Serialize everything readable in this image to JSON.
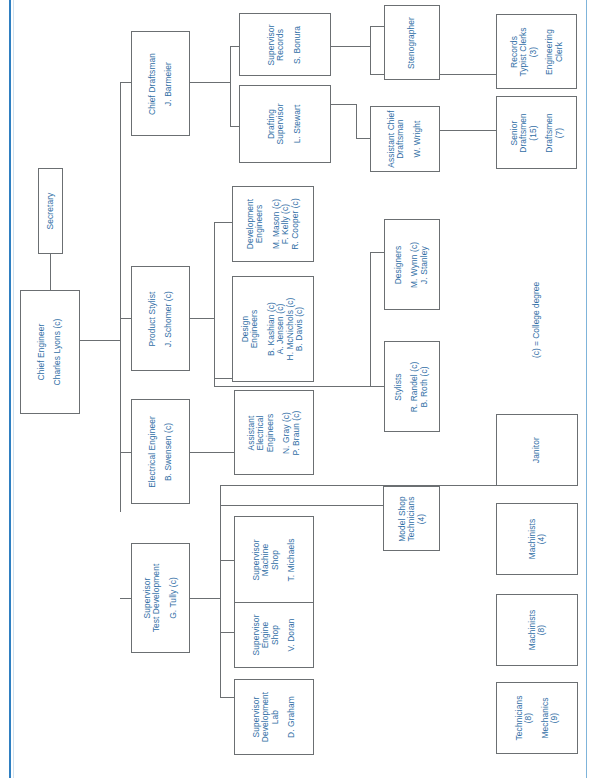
{
  "document": {
    "type": "organization-chart",
    "orientation": "rotated-90-ccw",
    "legend": "(c) = College degree"
  },
  "chart_data": {
    "type": "diagram",
    "legend": "(c) = College degree",
    "nodes": [
      {
        "id": "chief-engineer",
        "title": "Chief Engineer",
        "people": "Charles Lyons (c)"
      },
      {
        "id": "secretary",
        "title": "Secretary",
        "people": ""
      },
      {
        "id": "chief-draftsman",
        "title": "Chief Draftsman",
        "people": "J. Barmeier"
      },
      {
        "id": "supervisor-records",
        "title": "Supervisor\nRecords",
        "people": "S. Bonura"
      },
      {
        "id": "drafting-supervisor",
        "title": "Drafting\nSupervisor",
        "people": "L. Stewart"
      },
      {
        "id": "stenographer",
        "title": "Stenographer",
        "people": ""
      },
      {
        "id": "records-typist",
        "title": "Records\nTypist Clerks\n(3)",
        "people": "Engineering\nClerk"
      },
      {
        "id": "asst-chief-draftsman",
        "title": "Assistant Chief\nDraftsman",
        "people": "W. Wright"
      },
      {
        "id": "senior-draftsmen",
        "title": "Senior\nDraftsmen\n(15)",
        "people": "Draftsmen\n(7)"
      },
      {
        "id": "product-stylist",
        "title": "Product Stylist",
        "people": "J. Schomer (c)"
      },
      {
        "id": "development-engineers",
        "title": "Development\nEngineers",
        "people": "M. Mason (c)\nF. Kelly (c)\nR. Cooper (c)"
      },
      {
        "id": "design-engineers",
        "title": "Design\nEngineers",
        "people": "B. Kashian (c)\nA. Jensen (c)\nH. McNichols (c)\nB. Davis (c)"
      },
      {
        "id": "designers",
        "title": "Designers",
        "people": "M. Wynn (c)\nJ. Stanley"
      },
      {
        "id": "stylists",
        "title": "Stylists",
        "people": "R. Randel (c)\nB. Roth (c)"
      },
      {
        "id": "electrical-engineer",
        "title": "Electrical Engineer",
        "people": "B. Swensen (c)"
      },
      {
        "id": "asst-electrical-engineers",
        "title": "Assistant\nElectrical\nEngineers",
        "people": "N. Gray (c)\nP. Braun (c)"
      },
      {
        "id": "supervisor-test-development",
        "title": "Supervisor\nTest Development",
        "people": "G. Tully (c)"
      },
      {
        "id": "supervisor-machine-shop",
        "title": "Supervisor\nMachine\nShop",
        "people": "T. Michaels"
      },
      {
        "id": "supervisor-engine-shop",
        "title": "Supervisor\nEngine\nShop",
        "people": "V. Doran"
      },
      {
        "id": "supervisor-development-lab",
        "title": "Supervisor\nDevelopment\nLab",
        "people": "D. Graham"
      },
      {
        "id": "model-shop-technicians",
        "title": "Model Shop\nTechnicians\n(4)",
        "people": ""
      },
      {
        "id": "janitor",
        "title": "Janitor",
        "people": ""
      },
      {
        "id": "machinists-4",
        "title": "Machinists\n(4)",
        "people": ""
      },
      {
        "id": "machinists-8",
        "title": "Machinists\n(8)",
        "people": ""
      },
      {
        "id": "technicians-mechanics",
        "title": "Technicians\n(8)",
        "people": "Mechanics\n(9)"
      }
    ],
    "edges": [
      {
        "from": "chief-engineer",
        "to": "secretary"
      },
      {
        "from": "chief-engineer",
        "to": "chief-draftsman"
      },
      {
        "from": "chief-engineer",
        "to": "product-stylist"
      },
      {
        "from": "chief-engineer",
        "to": "electrical-engineer"
      },
      {
        "from": "chief-engineer",
        "to": "supervisor-test-development"
      },
      {
        "from": "chief-draftsman",
        "to": "supervisor-records"
      },
      {
        "from": "chief-draftsman",
        "to": "drafting-supervisor"
      },
      {
        "from": "supervisor-records",
        "to": "stenographer"
      },
      {
        "from": "supervisor-records",
        "to": "records-typist"
      },
      {
        "from": "drafting-supervisor",
        "to": "asst-chief-draftsman"
      },
      {
        "from": "drafting-supervisor",
        "to": "senior-draftsmen"
      },
      {
        "from": "product-stylist",
        "to": "development-engineers"
      },
      {
        "from": "product-stylist",
        "to": "design-engineers"
      },
      {
        "from": "product-stylist",
        "to": "designers"
      },
      {
        "from": "product-stylist",
        "to": "stylists"
      },
      {
        "from": "electrical-engineer",
        "to": "asst-electrical-engineers"
      },
      {
        "from": "supervisor-test-development",
        "to": "supervisor-machine-shop"
      },
      {
        "from": "supervisor-test-development",
        "to": "supervisor-engine-shop"
      },
      {
        "from": "supervisor-test-development",
        "to": "supervisor-development-lab"
      },
      {
        "from": "supervisor-test-development",
        "to": "model-shop-technicians"
      },
      {
        "from": "supervisor-test-development",
        "to": "janitor"
      }
    ],
    "colors": {
      "text": "#2f6ea5",
      "box_border": "#6b6f72",
      "connector": "#6b6f72",
      "page_rule": "#2f7fc1",
      "background": "#ffffff"
    }
  }
}
